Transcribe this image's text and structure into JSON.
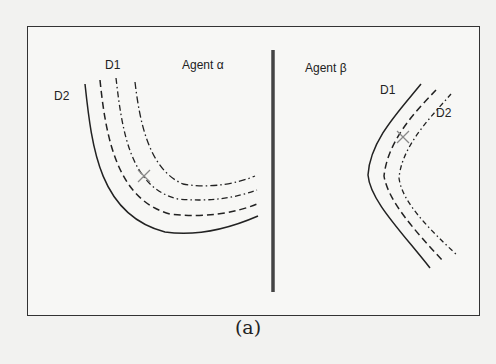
{
  "figure": {
    "caption": "(a)",
    "left_panel": {
      "agent_label": "Agent α",
      "curve_labels": {
        "d1": "D1",
        "d2": "D2"
      }
    },
    "right_panel": {
      "agent_label": "Agent β",
      "curve_labels": {
        "d1": "D1",
        "d2": "D2"
      }
    },
    "colors": {
      "line": "#222222",
      "marker": "#888888",
      "divider": "#444444"
    }
  }
}
